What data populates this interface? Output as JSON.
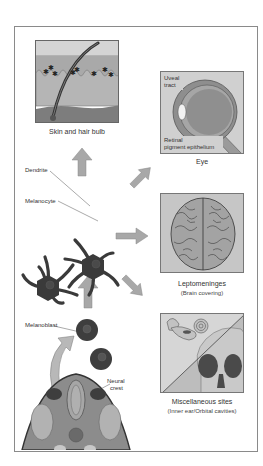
{
  "figure": {
    "type": "melanocyte-origin-and-distribution-diagram"
  },
  "panels": {
    "skin": {
      "caption": "Skin and hair bulb"
    },
    "eye": {
      "caption": "Eye",
      "labels": {
        "uveal_tract_line1": "Uveal",
        "uveal_tract_line2": "tract",
        "rpe_line1": "Retinal",
        "rpe_line2": "pigment epithelium"
      }
    },
    "brain": {
      "caption": "Leptomeninges",
      "subcaption": "(Brain covering)"
    },
    "misc": {
      "caption": "Miscellaneous sites",
      "subcaption": "(Inner ear/Orbital cavities)"
    }
  },
  "center": {
    "labels": {
      "dendrite": "Dendrite",
      "melanocyte": "Melanocyte"
    }
  },
  "origin": {
    "labels": {
      "melanoblast": "Melanoblast",
      "neural_crest_line1": "Neural",
      "neural_crest_line2": "crest"
    }
  },
  "arrows": [
    {
      "id": "to-skin",
      "direction": "up"
    },
    {
      "id": "to-eye",
      "direction": "up-right"
    },
    {
      "id": "to-brain",
      "direction": "right"
    },
    {
      "id": "to-misc",
      "direction": "down-right"
    },
    {
      "id": "from-origin",
      "direction": "up"
    }
  ],
  "colors": {
    "frame": "#8a8a8a",
    "arrow": "#a8a8a8",
    "cell": "#3a3a3a",
    "panel_bg": "#c9c9c9",
    "text": "#333333"
  }
}
